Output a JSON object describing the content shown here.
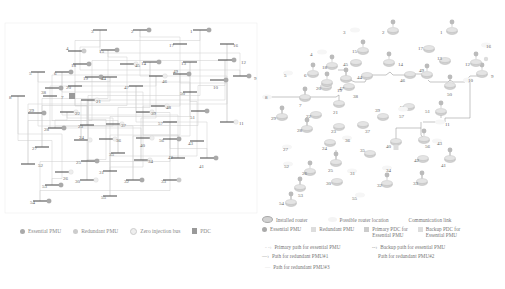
{
  "left_diagram": {
    "buses": [
      {
        "id": "1",
        "x": 200,
        "y": 30,
        "lx": 190,
        "ly": 31,
        "pmu": "essential"
      },
      {
        "id": "2",
        "x": 140,
        "y": 30,
        "lx": 131,
        "ly": 31,
        "pmu": "essential"
      },
      {
        "id": "3",
        "x": 100,
        "y": 30,
        "lx": 91,
        "ly": 31,
        "pmu": ""
      },
      {
        "id": "4",
        "x": 75,
        "y": 51,
        "lx": 66,
        "ly": 48,
        "pmu": "redundant"
      },
      {
        "id": "5",
        "x": 38,
        "y": 72,
        "lx": 29,
        "ly": 73,
        "pmu": ""
      },
      {
        "id": "6",
        "x": 62,
        "y": 72,
        "lx": 54,
        "ly": 73,
        "pmu": "essential"
      },
      {
        "id": "7",
        "x": 50,
        "y": 96,
        "lx": 61,
        "ly": 97,
        "pmu": ""
      },
      {
        "id": "8",
        "x": 18,
        "y": 96,
        "lx": 9,
        "ly": 97,
        "pmu": ""
      },
      {
        "id": "9",
        "x": 240,
        "y": 76,
        "lx": 254,
        "ly": 78,
        "pmu": "essential"
      },
      {
        "id": "10",
        "x": 217,
        "y": 80,
        "lx": 213,
        "ly": 87,
        "pmu": "essential"
      },
      {
        "id": "11",
        "x": 227,
        "y": 122,
        "lx": 239,
        "ly": 123,
        "pmu": "zero"
      },
      {
        "id": "12",
        "x": 225,
        "y": 60,
        "lx": 241,
        "ly": 62,
        "pmu": "essential"
      },
      {
        "id": "13",
        "x": 190,
        "y": 62,
        "lx": 181,
        "ly": 63,
        "pmu": ""
      },
      {
        "id": "14",
        "x": 150,
        "y": 62,
        "lx": 141,
        "ly": 63,
        "pmu": "essential"
      },
      {
        "id": "15",
        "x": 108,
        "y": 50,
        "lx": 99,
        "ly": 51,
        "pmu": "essential"
      },
      {
        "id": "16",
        "x": 227,
        "y": 44,
        "lx": 233,
        "ly": 45,
        "pmu": ""
      },
      {
        "id": "17",
        "x": 180,
        "y": 44,
        "lx": 169,
        "ly": 45,
        "pmu": ""
      },
      {
        "id": "18",
        "x": 80,
        "y": 64,
        "lx": 71,
        "ly": 65,
        "pmu": "essential"
      },
      {
        "id": "19",
        "x": 92,
        "y": 77,
        "lx": 83,
        "ly": 78,
        "pmu": "essential"
      },
      {
        "id": "20",
        "x": 75,
        "y": 86,
        "lx": 66,
        "ly": 87,
        "pmu": ""
      },
      {
        "id": "21",
        "x": 88,
        "y": 100,
        "lx": 96,
        "ly": 101,
        "pmu": "zero"
      },
      {
        "id": "22",
        "x": 67,
        "y": 112,
        "lx": 75,
        "ly": 113,
        "pmu": "zero"
      },
      {
        "id": "23",
        "x": 87,
        "y": 125,
        "lx": 78,
        "ly": 126,
        "pmu": ""
      },
      {
        "id": "24",
        "x": 81,
        "y": 140,
        "lx": 79,
        "ly": 137,
        "pmu": "zero"
      },
      {
        "id": "25",
        "x": 88,
        "y": 161,
        "lx": 76,
        "ly": 162,
        "pmu": "essential"
      },
      {
        "id": "26",
        "x": 62,
        "y": 172,
        "lx": 63,
        "ly": 178,
        "pmu": "zero"
      },
      {
        "id": "27",
        "x": 42,
        "y": 147,
        "lx": 32,
        "ly": 148,
        "pmu": ""
      },
      {
        "id": "28",
        "x": 55,
        "y": 128,
        "lx": 44,
        "ly": 129,
        "pmu": "essential"
      },
      {
        "id": "29",
        "x": 35,
        "y": 113,
        "lx": 29,
        "ly": 110,
        "pmu": "essential"
      },
      {
        "id": "30",
        "x": 87,
        "y": 180,
        "lx": 75,
        "ly": 181,
        "pmu": "zero"
      },
      {
        "id": "31",
        "x": 110,
        "y": 171,
        "lx": 99,
        "ly": 172,
        "pmu": ""
      },
      {
        "id": "32",
        "x": 133,
        "y": 180,
        "lx": 124,
        "ly": 181,
        "pmu": "essential"
      },
      {
        "id": "33",
        "x": 170,
        "y": 180,
        "lx": 161,
        "ly": 181,
        "pmu": "redundant"
      },
      {
        "id": "34",
        "x": 141,
        "y": 160,
        "lx": 148,
        "ly": 161,
        "pmu": "zero"
      },
      {
        "id": "35",
        "x": 118,
        "y": 153,
        "lx": 109,
        "ly": 154,
        "pmu": ""
      },
      {
        "id": "36",
        "x": 106,
        "y": 139,
        "lx": 116,
        "ly": 140,
        "pmu": "zero"
      },
      {
        "id": "37",
        "x": 113,
        "y": 124,
        "lx": 121,
        "ly": 125,
        "pmu": "zero"
      },
      {
        "id": "38",
        "x": 52,
        "y": 88,
        "lx": 41,
        "ly": 92,
        "pmu": "essential"
      },
      {
        "id": "39",
        "x": 143,
        "y": 112,
        "lx": 151,
        "ly": 113,
        "pmu": "zero"
      },
      {
        "id": "40",
        "x": 143,
        "y": 138,
        "lx": 140,
        "ly": 145,
        "pmu": "zero"
      },
      {
        "id": "41",
        "x": 207,
        "y": 158,
        "lx": 199,
        "ly": 166,
        "pmu": "essential"
      },
      {
        "id": "42",
        "x": 178,
        "y": 158,
        "lx": 168,
        "ly": 157,
        "pmu": ""
      },
      {
        "id": "43",
        "x": 197,
        "y": 141,
        "lx": 188,
        "ly": 143,
        "pmu": ""
      },
      {
        "id": "44",
        "x": 110,
        "y": 77,
        "lx": 101,
        "ly": 78,
        "pmu": ""
      },
      {
        "id": "45",
        "x": 127,
        "y": 64,
        "lx": 135,
        "ly": 65,
        "pmu": "zero"
      },
      {
        "id": "46",
        "x": 156,
        "y": 76,
        "lx": 162,
        "ly": 81,
        "pmu": "zero"
      },
      {
        "id": "47",
        "x": 136,
        "y": 86,
        "lx": 124,
        "ly": 87,
        "pmu": ""
      },
      {
        "id": "48",
        "x": 158,
        "y": 106,
        "lx": 166,
        "ly": 107,
        "pmu": "zero"
      },
      {
        "id": "49",
        "x": 180,
        "y": 74,
        "lx": 173,
        "ly": 71,
        "pmu": "essential"
      },
      {
        "id": "50",
        "x": 190,
        "y": 92,
        "lx": 180,
        "ly": 93,
        "pmu": ""
      },
      {
        "id": "51",
        "x": 198,
        "y": 111,
        "lx": 190,
        "ly": 117,
        "pmu": "essential"
      },
      {
        "id": "52",
        "x": 28,
        "y": 164,
        "lx": 38,
        "ly": 165,
        "pmu": ""
      },
      {
        "id": "53",
        "x": 52,
        "y": 185,
        "lx": 42,
        "ly": 186,
        "pmu": "essential"
      },
      {
        "id": "54",
        "x": 40,
        "y": 201,
        "lx": 30,
        "ly": 202,
        "pmu": "essential"
      },
      {
        "id": "55",
        "x": 110,
        "y": 196,
        "lx": 101,
        "ly": 197,
        "pmu": ""
      },
      {
        "id": "56",
        "x": 170,
        "y": 139,
        "lx": 159,
        "ly": 140,
        "pmu": "essential"
      },
      {
        "id": "57",
        "x": 170,
        "y": 122,
        "lx": 158,
        "ly": 123,
        "pmu": ""
      }
    ],
    "pdc": {
      "x": 71,
      "y": 96
    },
    "legend": [
      {
        "symbol": "essential",
        "label": "Essential PMU"
      },
      {
        "symbol": "redundant",
        "label": "Redundant PMU"
      },
      {
        "symbol": "zero",
        "label": "Zero injection bus"
      },
      {
        "symbol": "pdc",
        "label": "PDC"
      }
    ]
  },
  "right_diagram": {
    "nodes": [
      {
        "id": "1",
        "x": 452,
        "y": 30,
        "lx": 440,
        "ly": 32,
        "router": true,
        "pmu": "essential"
      },
      {
        "id": "2",
        "x": 393,
        "y": 30,
        "lx": 382,
        "ly": 32,
        "router": true,
        "pmu": "essential"
      },
      {
        "id": "3",
        "x": 355,
        "y": 30,
        "lx": 343,
        "ly": 32,
        "router": false,
        "pmu": ""
      },
      {
        "id": "4",
        "x": 322,
        "y": 52,
        "lx": 310,
        "ly": 54,
        "router": false,
        "pmu": ""
      },
      {
        "id": "5",
        "x": 288,
        "y": 73,
        "lx": 284,
        "ly": 75,
        "router": false,
        "pmu": ""
      },
      {
        "id": "6",
        "x": 313,
        "y": 73,
        "lx": 304,
        "ly": 75,
        "router": true,
        "pmu": "essential"
      },
      {
        "id": "7",
        "x": 305,
        "y": 97,
        "lx": 299,
        "ly": 105,
        "router": true,
        "pmu": "essential"
      },
      {
        "id": "8",
        "x": 267,
        "y": 97,
        "lx": 265,
        "ly": 97,
        "router": false,
        "pmu": ""
      },
      {
        "id": "9",
        "x": 482,
        "y": 73,
        "lx": 491,
        "ly": 76,
        "router": true,
        "pmu": "essential"
      },
      {
        "id": "10",
        "x": 468,
        "y": 80,
        "lx": 468,
        "ly": 80,
        "router": false,
        "pmu": ""
      },
      {
        "id": "11",
        "x": 440,
        "y": 122,
        "lx": 445,
        "ly": 124,
        "router": false,
        "pmu": ""
      },
      {
        "id": "12",
        "x": 476,
        "y": 62,
        "lx": 465,
        "ly": 64,
        "router": true,
        "pmu": "essential"
      },
      {
        "id": "13",
        "x": 445,
        "y": 60,
        "lx": 437,
        "ly": 58,
        "router": true,
        "pmu": ""
      },
      {
        "id": "14",
        "x": 389,
        "y": 62,
        "lx": 398,
        "ly": 64,
        "router": true,
        "pmu": "essential"
      },
      {
        "id": "15",
        "x": 363,
        "y": 50,
        "lx": 352,
        "ly": 51,
        "router": true,
        "pmu": "essential"
      },
      {
        "id": "16",
        "x": 486,
        "y": 45,
        "lx": 486,
        "ly": 46,
        "router": false,
        "pmu": "zero"
      },
      {
        "id": "17",
        "x": 429,
        "y": 48,
        "lx": 418,
        "ly": 48,
        "router": true,
        "pmu": ""
      },
      {
        "id": "18",
        "x": 332,
        "y": 65,
        "lx": 322,
        "ly": 67,
        "router": true,
        "pmu": "essential"
      },
      {
        "id": "19",
        "x": 346,
        "y": 78,
        "lx": 337,
        "ly": 90,
        "router": true,
        "pmu": "essential"
      },
      {
        "id": "20",
        "x": 326,
        "y": 86,
        "lx": 316,
        "ly": 88,
        "router": true,
        "pmu": ""
      },
      {
        "id": "21",
        "x": 339,
        "y": 103,
        "lx": 333,
        "ly": 112,
        "router": true,
        "pmu": ""
      },
      {
        "id": "22",
        "x": 316,
        "y": 114,
        "lx": 306,
        "ly": 116,
        "router": true,
        "pmu": ""
      },
      {
        "id": "23",
        "x": 339,
        "y": 126,
        "lx": 331,
        "ly": 131,
        "router": true,
        "pmu": ""
      },
      {
        "id": "24",
        "x": 330,
        "y": 142,
        "lx": 322,
        "ly": 148,
        "router": true,
        "pmu": ""
      },
      {
        "id": "25",
        "x": 336,
        "y": 162,
        "lx": 328,
        "ly": 170,
        "router": true,
        "pmu": "essential"
      },
      {
        "id": "26",
        "x": 310,
        "y": 171,
        "lx": 302,
        "ly": 173,
        "router": true,
        "pmu": "essential"
      },
      {
        "id": "27",
        "x": 287,
        "y": 147,
        "lx": 283,
        "ly": 149,
        "router": false,
        "pmu": ""
      },
      {
        "id": "28",
        "x": 307,
        "y": 128,
        "lx": 297,
        "ly": 130,
        "router": true,
        "pmu": "essential"
      },
      {
        "id": "29",
        "x": 282,
        "y": 116,
        "lx": 271,
        "ly": 118,
        "router": true,
        "pmu": "essential"
      },
      {
        "id": "30",
        "x": 337,
        "y": 181,
        "lx": 326,
        "ly": 183,
        "router": true,
        "pmu": ""
      },
      {
        "id": "31",
        "x": 352,
        "y": 171,
        "lx": 350,
        "ly": 173,
        "router": false,
        "pmu": ""
      },
      {
        "id": "32",
        "x": 387,
        "y": 183,
        "lx": 377,
        "ly": 185,
        "router": true,
        "pmu": "essential"
      },
      {
        "id": "33",
        "x": 422,
        "y": 181,
        "lx": 413,
        "ly": 183,
        "router": true,
        "pmu": "essential"
      },
      {
        "id": "34",
        "x": 387,
        "y": 168,
        "lx": 386,
        "ly": 170,
        "router": false,
        "pmu": ""
      },
      {
        "id": "35",
        "x": 370,
        "y": 153,
        "lx": 360,
        "ly": 150,
        "router": true,
        "pmu": ""
      },
      {
        "id": "36",
        "x": 347,
        "y": 138,
        "lx": 345,
        "ly": 140,
        "router": false,
        "pmu": ""
      },
      {
        "id": "37",
        "x": 363,
        "y": 124,
        "lx": 365,
        "ly": 131,
        "router": true,
        "pmu": ""
      },
      {
        "id": "38",
        "x": 327,
        "y": 82,
        "lx": 353,
        "ly": 96,
        "router": true,
        "pmu": "essential"
      },
      {
        "id": "39",
        "x": 383,
        "y": 116,
        "lx": 375,
        "ly": 110,
        "router": true,
        "pmu": ""
      },
      {
        "id": "40",
        "x": 396,
        "y": 141,
        "lx": 386,
        "ly": 146,
        "router": true,
        "pmu": "redundant"
      },
      {
        "id": "41",
        "x": 450,
        "y": 158,
        "lx": 441,
        "ly": 165,
        "router": true,
        "pmu": "essential"
      },
      {
        "id": "42",
        "x": 423,
        "y": 158,
        "lx": 414,
        "ly": 160,
        "router": true,
        "pmu": ""
      },
      {
        "id": "43",
        "x": 437,
        "y": 141,
        "lx": 437,
        "ly": 143,
        "router": false,
        "pmu": ""
      },
      {
        "id": "44",
        "x": 367,
        "y": 75,
        "lx": 357,
        "ly": 77,
        "router": true,
        "pmu": ""
      },
      {
        "id": "45",
        "x": 356,
        "y": 62,
        "lx": 343,
        "ly": 64,
        "router": true,
        "pmu": ""
      },
      {
        "id": "46",
        "x": 410,
        "y": 74,
        "lx": 400,
        "ly": 80,
        "router": true,
        "pmu": ""
      },
      {
        "id": "47",
        "x": 349,
        "y": 86,
        "lx": 339,
        "ly": 88,
        "router": true,
        "pmu": ""
      },
      {
        "id": "48",
        "x": 409,
        "y": 106,
        "lx": 399,
        "ly": 107,
        "router": true,
        "pmu": ""
      },
      {
        "id": "49",
        "x": 427,
        "y": 74,
        "lx": 419,
        "ly": 70,
        "router": true,
        "pmu": "essential"
      },
      {
        "id": "50",
        "x": 450,
        "y": 85,
        "lx": 447,
        "ly": 94,
        "router": true,
        "pmu": "essential"
      },
      {
        "id": "51",
        "x": 441,
        "y": 111,
        "lx": 425,
        "ly": 111,
        "router": true,
        "pmu": "essential"
      },
      {
        "id": "52",
        "x": 288,
        "y": 164,
        "lx": 284,
        "ly": 166,
        "router": false,
        "pmu": ""
      },
      {
        "id": "53",
        "x": 300,
        "y": 187,
        "lx": 298,
        "ly": 195,
        "router": true,
        "pmu": "essential"
      },
      {
        "id": "54",
        "x": 291,
        "y": 202,
        "lx": 279,
        "ly": 203,
        "router": true,
        "pmu": "essential"
      },
      {
        "id": "55",
        "x": 360,
        "y": 195,
        "lx": 352,
        "ly": 198,
        "router": false,
        "pmu": ""
      },
      {
        "id": "56",
        "x": 424,
        "y": 139,
        "lx": 425,
        "ly": 146,
        "router": true,
        "pmu": "essential"
      },
      {
        "id": "57",
        "x": 403,
        "y": 109,
        "lx": 399,
        "ly": 116,
        "router": false,
        "pmu": ""
      }
    ],
    "legend": {
      "row1": [
        {
          "symbol": "installed-router",
          "label": "Installed router"
        },
        {
          "symbol": "possible-router",
          "label": "Possible router location"
        },
        {
          "symbol": "communication-link",
          "label": "Communication link"
        }
      ],
      "row2": [
        {
          "symbol": "essential",
          "label": "Essential PMU"
        },
        {
          "symbol": "redundant",
          "label": "Redundant PMU"
        },
        {
          "symbol": "primary-pdc",
          "label": "Primary PDC for",
          "label2": "Essential PMU"
        },
        {
          "symbol": "backup-pdc",
          "label": "Backup PDC for",
          "label2": "Essential PMU"
        }
      ],
      "paths": [
        {
          "label": "Primary path for essential PMU"
        },
        {
          "label": "Backup path for essential PMU"
        },
        {
          "label": "Path for redundant PMU#1"
        },
        {
          "label": "Path for redundant PMU#2"
        },
        {
          "label": "Path for redundant PMU#3"
        }
      ]
    }
  }
}
